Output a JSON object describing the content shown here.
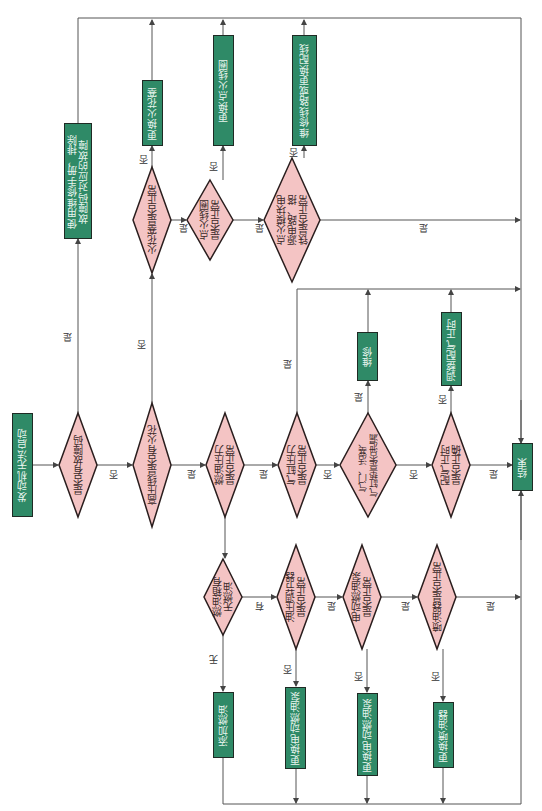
{
  "flowchart": {
    "colors": {
      "process_fill": "#2f8a67",
      "decision_fill": "#f4c4c4",
      "border": "#1f2a24",
      "line": "#555555"
    },
    "start": {
      "label": "发动机无法启动"
    },
    "end": {
      "label": "结束"
    },
    "decisions": [
      {
        "id": "d1",
        "label": "是否有故障码"
      },
      {
        "id": "d2",
        "label": "高压线是否有火花"
      },
      {
        "id": "d3",
        "label": "火花塞是否正常"
      },
      {
        "id": "d4",
        "label": "点火线圈\n是否正常"
      },
      {
        "id": "d5",
        "label": "点火模块电\n源电路、搭\n铁是否正常"
      },
      {
        "id": "d6",
        "label": "燃油压力\n是否正常"
      },
      {
        "id": "d7",
        "label": "气缸压力\n是否正常"
      },
      {
        "id": "d8",
        "label": "气门、活塞、\n气缸垫是否泄漏"
      },
      {
        "id": "d9",
        "label": "配气正时\n是否正确"
      },
      {
        "id": "d10",
        "label": "燃油箱有\n无燃油"
      },
      {
        "id": "d11",
        "label": "油压调节器\n是否正常"
      },
      {
        "id": "d12",
        "label": "电动燃油泵\n是否正常"
      },
      {
        "id": "d13",
        "label": "喷油器是否正常"
      }
    ],
    "processes": [
      {
        "id": "p1",
        "label": "使用维修手册，排除\n故障码对应的故障"
      },
      {
        "id": "p2",
        "label": "更换火花塞"
      },
      {
        "id": "p3",
        "label": "更换点火线圈"
      },
      {
        "id": "p4",
        "label": "维修线路或更换配线"
      },
      {
        "id": "p5",
        "label": "维修"
      },
      {
        "id": "p6",
        "label": "调整配气正时"
      },
      {
        "id": "p7",
        "label": "添加燃油"
      },
      {
        "id": "p8",
        "label": "更换电动燃油泵"
      },
      {
        "id": "p9",
        "label": "更换电动燃油泵"
      },
      {
        "id": "p10",
        "label": "更换喷油器"
      }
    ],
    "edge_labels": {
      "yes": "是",
      "no": "否",
      "have": "有",
      "none": "无"
    }
  }
}
